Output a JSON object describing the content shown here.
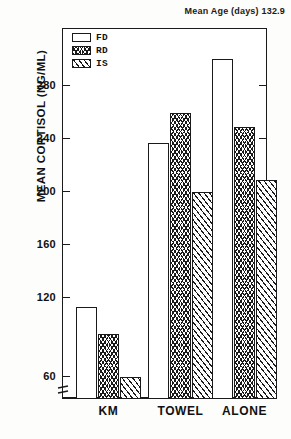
{
  "figure": {
    "note": "Mean Age (days) 132.9",
    "ylabel": "MEAN CORTISOL (NG/ML)"
  },
  "legend": {
    "items": [
      {
        "key": "FD",
        "label": "FD",
        "pattern": "open"
      },
      {
        "key": "RD",
        "label": "RD",
        "pattern": "chevron-hatch"
      },
      {
        "key": "IS",
        "label": "IS",
        "pattern": "diagonal-hatch"
      }
    ]
  },
  "axis": {
    "yticks": [
      60,
      120,
      160,
      200,
      240,
      280
    ],
    "ytick_labels": [
      "60",
      "120",
      "160",
      "200",
      "240",
      "280"
    ],
    "axis_break": true,
    "ymin_display": 44,
    "ymax_display": 310
  },
  "chart_data": {
    "type": "bar",
    "title": "Mean Age (days) 132.9",
    "xlabel": "",
    "ylabel": "MEAN CORTISOL (NG/ML)",
    "categories": [
      "KM",
      "TOWEL",
      "ALONE"
    ],
    "series": [
      {
        "name": "FD",
        "values": [
          112,
          236,
          300
        ]
      },
      {
        "name": "RD",
        "values": [
          92,
          259,
          248
        ]
      },
      {
        "name": "IS",
        "values": [
          59,
          199,
          208
        ]
      }
    ],
    "ylim": [
      44,
      310
    ],
    "yticks": [
      60,
      120,
      160,
      200,
      240,
      280
    ],
    "grid": false,
    "legend_position": "top-left",
    "axis_break_below": 60
  }
}
